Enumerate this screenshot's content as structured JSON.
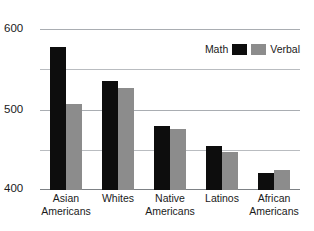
{
  "chart_data": {
    "type": "bar",
    "title": "",
    "subtitle": "",
    "xlabel": "",
    "ylabel": "",
    "ylim": [
      400,
      600
    ],
    "yticks": [
      400,
      500,
      600
    ],
    "ytick_labels": [
      "400",
      "500",
      "600"
    ],
    "gridlines": [
      400,
      450,
      500,
      550,
      600
    ],
    "grid": true,
    "legend_position": "top-right",
    "categories": [
      "Asian Americans",
      "Whites",
      "Native Americans",
      "Latinos",
      "African Americans"
    ],
    "category_lines": [
      [
        "Asian",
        "Americans"
      ],
      [
        "Whites"
      ],
      [
        "Native",
        "Americans"
      ],
      [
        "Latinos"
      ],
      [
        "African",
        "Americans"
      ]
    ],
    "series": [
      {
        "name": "Math",
        "color": "#0d0d0d",
        "values": [
          578,
          536,
          480,
          455,
          421
        ]
      },
      {
        "name": "Verbal",
        "color": "#8c8c8c",
        "values": [
          507,
          527,
          476,
          447,
          425
        ]
      }
    ]
  },
  "legend": {
    "math_label": "Math",
    "verbal_label": "Verbal"
  },
  "axis": {
    "y_top_label": "600",
    "y_mid_label": "500",
    "y_bottom_label": "400"
  }
}
